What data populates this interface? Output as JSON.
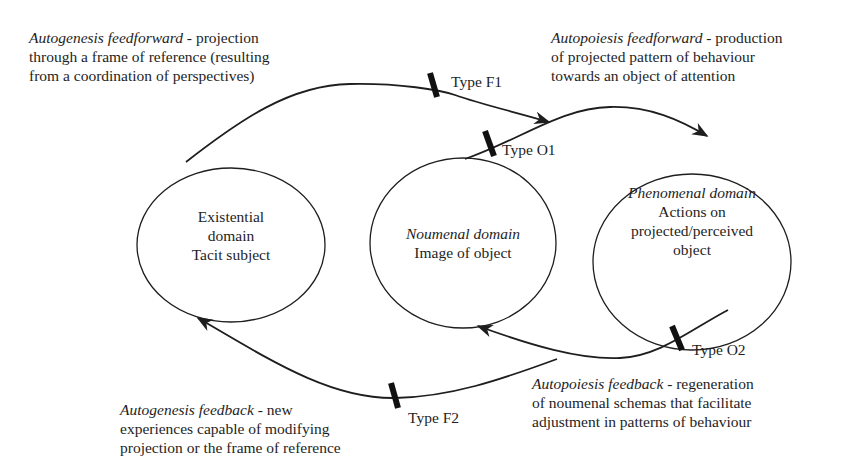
{
  "diagram": {
    "nodes": [
      {
        "id": "existential",
        "lines": [
          "Existential",
          "domain",
          "Tacit subject"
        ],
        "italic_title": null
      },
      {
        "id": "noumenal",
        "italic_title": "Noumenal domain",
        "lines": [
          "Image of object"
        ]
      },
      {
        "id": "phenomenal",
        "italic_title": "Phenomenal domain",
        "lines": [
          "Actions on",
          "projected/perceived",
          "object"
        ]
      }
    ],
    "edges": [
      {
        "id": "F1",
        "label": "Type F1",
        "from": "existential",
        "to": "phenomenal"
      },
      {
        "id": "O1",
        "label": "Type O1",
        "from": "noumenal",
        "to": "phenomenal"
      },
      {
        "id": "O2",
        "label": "Type O2",
        "from": "phenomenal",
        "to": "noumenal"
      },
      {
        "id": "F2",
        "label": "Type F2",
        "from": "phenomenal",
        "to": "existential"
      }
    ],
    "annotations": {
      "autogenesis_feedforward": {
        "title": "Autogenesis feedforward",
        "line1": " - projection",
        "line2": "through a frame of reference (resulting",
        "line3": "from a coordination of perspectives)"
      },
      "autopoiesis_feedforward": {
        "title": "Autopoiesis feedforward",
        "line1": " - production",
        "line2": "of projected pattern of behaviour",
        "line3": "towards an object of attention"
      },
      "autogenesis_feedback": {
        "title": "Autogenesis feedback",
        "line1": " - new",
        "line2": "experiences capable of modifying",
        "line3": "projection or the frame of reference"
      },
      "autopoiesis_feedback": {
        "title": "Autopoiesis feedback",
        "line1": " - regeneration",
        "line2": "of noumenal schemas that facilitate",
        "line3": "adjustment in patterns of behaviour"
      }
    },
    "colors": {
      "line": "#1e1e1e",
      "background": "#ffffff"
    }
  }
}
